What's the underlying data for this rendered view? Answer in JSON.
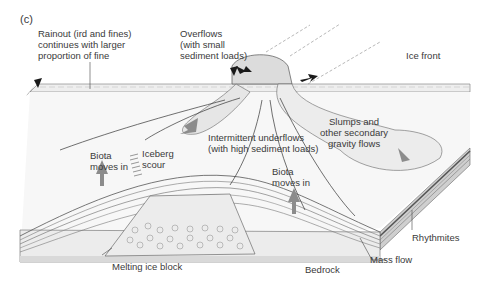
{
  "panel_label": "(c)",
  "labels": {
    "rainout": "Rainout (ird and fines)\ncontinues with larger\nproportion of fine",
    "overflows": "Overflows\n(with small\nsediment loads)",
    "ice_front": "Ice front",
    "iceberg_scour": "Iceberg\nscour",
    "intermittent_underflows": "Intermittent underflows\n(with high sediment loads)",
    "slumps": "Slumps and\nother secondary\ngravity flows",
    "biota_left": "Biota\nmoves in",
    "biota_right": "Biota\nmoves in",
    "rhythmites": "Rhythmites",
    "mass_flow": "Mass flow",
    "bedrock": "Bedrock",
    "melting_ice_block": "Melting ice block"
  },
  "colors": {
    "water_surface": "#efefef",
    "lake_floor": "#f6f6f6",
    "arrow_grey": "#8c8c8c",
    "arrow_black": "#1a1a1a",
    "bedrock": "#d9d9d9",
    "layer_dark": "#6e6e6e",
    "plume": "#e4e4e4"
  }
}
